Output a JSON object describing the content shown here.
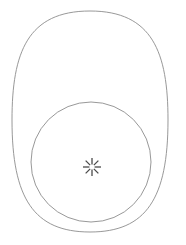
{
  "canvas": {
    "width": 186,
    "height": 245,
    "background_color": "#ffffff",
    "description": "Line-art sketch: a large egg-shaped outline with a circle overlapping its lower portion and a small starburst glyph at the center."
  },
  "style": {
    "stroke_color": "#8c8c8c",
    "stroke_width": 0.9,
    "icon_color": "#4a4a4a",
    "icon_stroke_width": 1.3
  },
  "shapes": {
    "outer_egg": {
      "name": "egg-outline",
      "label": "Outer egg outline",
      "bounds": {
        "x": 12,
        "y": 11,
        "width": 156,
        "height": 221
      },
      "center_x": 90,
      "top_y": 11,
      "bottom_y": 232,
      "left_x": 12,
      "right_x": 168,
      "widest_y": 120
    },
    "inner_circle": {
      "name": "circle-outline",
      "label": "Inner circle outline",
      "center_x": 91,
      "center_y": 162,
      "radius": 60,
      "top_y": 102,
      "bottom_y": 222,
      "left_x": 31,
      "right_x": 151
    }
  },
  "icon": {
    "name": "starburst-icon",
    "label": "Starburst sparkle",
    "center_x": 92,
    "center_y": 167,
    "ray_count": 8,
    "inner_radius": 2.6,
    "outer_radius": 9.0,
    "color": "#4a4a4a",
    "angles_deg": [
      0,
      45,
      90,
      135,
      180,
      225,
      270,
      315
    ]
  }
}
